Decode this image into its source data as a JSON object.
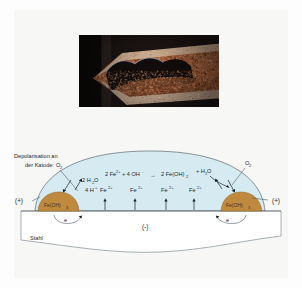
{
  "figure": {
    "photo": {
      "name": "corroded-pipe-photograph",
      "subject": "rusted steel pipe cut open showing internal corrosion",
      "colors": {
        "rust": "#a6603c",
        "dark_rust": "#6b3a24",
        "light_scale": "#c8a88c",
        "cavity": "#120d0c",
        "background": "#1b1412",
        "steel_edge": "#8d9194"
      }
    },
    "diagram": {
      "name": "oxygen-corrosion-cell-diagram",
      "colors": {
        "droplet_fill": "#d6eaf2",
        "droplet_edge": "#46525c",
        "mound_fill": "#c08a3e",
        "mound_dark": "#8d5f23",
        "steel_fill": "#ffffff",
        "steel_edge": "#6f7a82",
        "text": "#1d2a33"
      },
      "labels": {
        "cathode_note_line1": "Depolarisation an",
        "cathode_note_line2": "der Katode:",
        "cathode_note_species": "O",
        "cathode_note_species_sub": "2",
        "oxygen_right": "O",
        "oxygen_right_sub": "2",
        "water": "2 H",
        "water_sub": "2",
        "water_tail": "O",
        "protons": "4 H",
        "protons_sup": "+",
        "anode_left_label": "Fe(OH)",
        "anode_left_sub": "3",
        "anode_right_label": "Fe(OH)",
        "anode_right_sub": "3",
        "pole_left": "(+)",
        "pole_right": "(+)",
        "pole_center": "(-)",
        "electron_left": "e",
        "electron_left_sup": "-",
        "electron_right": "e",
        "electron_right_sup": "-",
        "substrate": "Stahl"
      },
      "equation": {
        "reactant_coef": "2 Fe",
        "reactant_sup": "2+",
        "plus": "+ 4 OH",
        "reactant2_sup": "-",
        "arrow": "→",
        "product": "2 Fe(OH)",
        "product_sub": "2",
        "addend": "+ H",
        "addend_sub": "2",
        "addend_tail": "O"
      },
      "ion_flux": [
        {
          "label": "Fe",
          "sup": "2+"
        },
        {
          "label": "Fe",
          "sup": "2+"
        },
        {
          "label": "Fe",
          "sup": "2+"
        },
        {
          "label": "Fe",
          "sup": "2+"
        }
      ]
    }
  }
}
